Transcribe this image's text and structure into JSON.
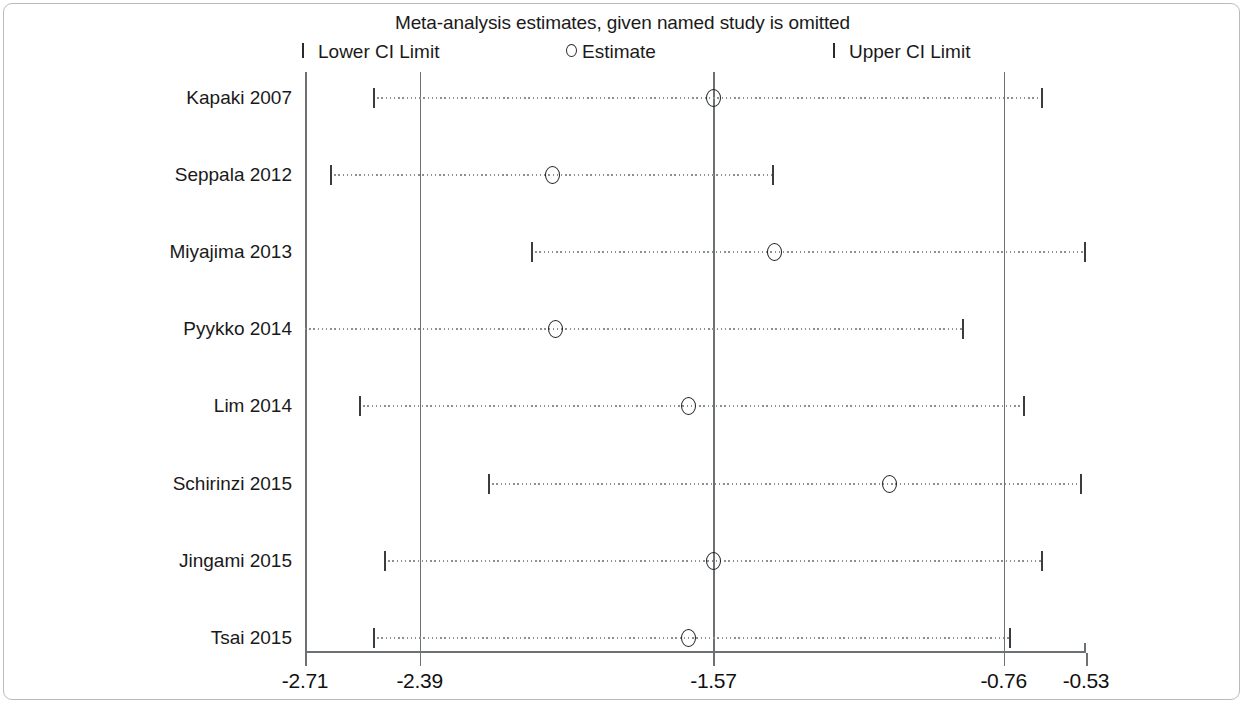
{
  "figure": {
    "title": "Meta-analysis estimates, given named study is omitted",
    "legend": [
      {
        "marker": "ci-limit-tick-icon",
        "label": "Lower CI Limit",
        "x_px": 302
      },
      {
        "marker": "estimate-circle-icon",
        "label": "Estimate",
        "x_px": 566
      },
      {
        "marker": "ci-limit-tick-icon",
        "label": "Upper CI Limit",
        "x_px": 833
      }
    ]
  },
  "chart_data": {
    "type": "influence-plot",
    "title": "Meta-analysis estimates, given named study is omitted",
    "xlabel": "",
    "ylabel": "",
    "xlim": [
      -2.71,
      -0.53
    ],
    "xticks": [
      -2.71,
      -2.39,
      -1.57,
      -0.76,
      -0.53
    ],
    "xtick_labels": [
      "-2.71",
      "-2.39",
      "-1.57",
      "-0.76",
      "-0.53"
    ],
    "grid": false,
    "legend_position": "top",
    "reference_lines": [
      {
        "value": -2.39,
        "role": "pooled-lower-ci"
      },
      {
        "value": -1.57,
        "role": "pooled-estimate"
      },
      {
        "value": -0.76,
        "role": "pooled-upper-ci"
      }
    ],
    "categories": [
      "Kapaki 2007",
      "Seppala 2012",
      "Miyajima 2013",
      "Pyykko 2014",
      "Lim 2014",
      "Schirinzi 2015",
      "Jingami 2015",
      "Tsai 2015"
    ],
    "series": [
      {
        "name": "Estimate",
        "values": [
          -1.57,
          -2.02,
          -1.4,
          -2.01,
          -1.64,
          -1.08,
          -1.57,
          -1.64
        ]
      },
      {
        "name": "Lower CI Limit",
        "values": [
          -2.52,
          -2.64,
          -2.08,
          -2.78,
          -2.56,
          -2.2,
          -2.49,
          -2.52
        ]
      },
      {
        "name": "Upper CI Limit",
        "values": [
          -0.65,
          -1.4,
          -0.53,
          -0.84,
          -0.7,
          -0.54,
          -0.65,
          -0.75
        ]
      }
    ],
    "rows": [
      {
        "label": "Kapaki 2007",
        "estimate": -1.57,
        "lower": -2.52,
        "upper": -0.65,
        "lower_clipped": false
      },
      {
        "label": "Seppala 2012",
        "estimate": -2.02,
        "lower": -2.64,
        "upper": -1.4,
        "lower_clipped": false
      },
      {
        "label": "Miyajima 2013",
        "estimate": -1.4,
        "lower": -2.08,
        "upper": -0.53,
        "lower_clipped": false
      },
      {
        "label": "Pyykko 2014",
        "estimate": -2.01,
        "lower": -2.78,
        "upper": -0.87,
        "lower_clipped": true
      },
      {
        "label": "Lim 2014",
        "estimate": -1.64,
        "lower": -2.56,
        "upper": -0.7,
        "lower_clipped": false
      },
      {
        "label": "Schirinzi 2015",
        "estimate": -1.08,
        "lower": -2.2,
        "upper": -0.54,
        "lower_clipped": false
      },
      {
        "label": "Jingami 2015",
        "estimate": -1.57,
        "lower": -2.49,
        "upper": -0.65,
        "lower_clipped": false
      },
      {
        "label": "Tsai 2015",
        "estimate": -1.64,
        "lower": -2.52,
        "upper": -0.74,
        "lower_clipped": false
      }
    ]
  },
  "colors": {
    "axis": "#6e7173",
    "marker": "#1f2122",
    "ci_line": "#8d9092",
    "text": "#1a1a1a",
    "frame": "#b9bcbe",
    "background": "#ffffff"
  }
}
